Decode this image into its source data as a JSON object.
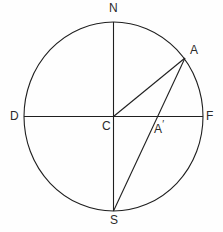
{
  "figure": {
    "background_color": "#fefefe",
    "stroke_color": "#1f1f1f",
    "label_color": "#2a2a2a",
    "stroke_width": 1.1
  },
  "circle": {
    "center_x": 113.5,
    "center_y": 116.5,
    "radius_x": 89.5,
    "radius_y": 94.5
  },
  "points": {
    "N": {
      "label": "N",
      "x": 113.5,
      "y": 22.0,
      "label_x": 109,
      "label_y": 2
    },
    "S": {
      "label": "S",
      "x": 113.5,
      "y": 211.0,
      "label_x": 110,
      "label_y": 214
    },
    "D": {
      "label": "D",
      "x": 24.0,
      "y": 116.5,
      "label_x": 10,
      "label_y": 110
    },
    "F": {
      "label": "F",
      "x": 203.0,
      "y": 116.5,
      "label_x": 206,
      "label_y": 110
    },
    "C": {
      "label": "C",
      "x": 113.5,
      "y": 116.5,
      "label_x": 102,
      "label_y": 120
    },
    "A": {
      "label": "A",
      "x": 185.0,
      "y": 58.0,
      "label_x": 190,
      "label_y": 44
    },
    "Aprime": {
      "label": "A",
      "prime": "′",
      "x": 151.0,
      "y": 116.5,
      "label_x": 154,
      "label_y": 119
    }
  },
  "segments": [
    {
      "name": "vertical-diameter",
      "from": "N",
      "to": "S",
      "x1": 113.5,
      "y1": 22.0,
      "x2": 113.5,
      "y2": 211.0
    },
    {
      "name": "horizontal-diameter",
      "from": "D",
      "to": "F",
      "x1": 24.0,
      "y1": 116.5,
      "x2": 203.0,
      "y2": 116.5
    },
    {
      "name": "radius-center-to-a",
      "from": "C",
      "to": "A",
      "x1": 113.5,
      "y1": 116.5,
      "x2": 185.0,
      "y2": 58.0
    },
    {
      "name": "chord-a-to-s",
      "from": "A",
      "to": "S",
      "x1": 185.0,
      "y1": 58.0,
      "x2": 113.5,
      "y2": 211.0
    }
  ]
}
